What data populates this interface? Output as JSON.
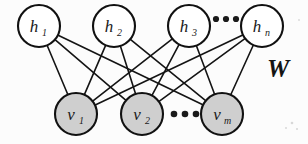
{
  "diagram": {
    "type": "restricted-boltzmann-machine",
    "background_color": "#fcfcfc",
    "edge_color": "#141414",
    "edge_width": 1.6,
    "hidden_layer": {
      "name": "hidden-units",
      "fill_color": "#ffffff",
      "stroke_color": "#111111",
      "stroke_width": 2.1,
      "radius": 21,
      "cy": 26,
      "nodes": [
        {
          "id": "h1",
          "base": "h",
          "sub": "1",
          "cx": 39
        },
        {
          "id": "h2",
          "base": "h",
          "sub": "2",
          "cx": 114
        },
        {
          "id": "h3",
          "base": "h",
          "sub": "3",
          "cx": 189
        },
        {
          "id": "hn",
          "base": "h",
          "sub": "n",
          "cx": 262
        }
      ],
      "ellipsis": {
        "label": "...",
        "cx": 226,
        "cy": 19,
        "dots": 3,
        "dot_radius": 3.1,
        "gap": 10
      }
    },
    "visible_layer": {
      "name": "visible-units",
      "fill_color": "#cfcfcf",
      "stroke_color": "#111111",
      "stroke_width": 2.1,
      "radius": 21,
      "cy": 114,
      "nodes": [
        {
          "id": "v1",
          "base": "v",
          "sub": "1",
          "cx": 76
        },
        {
          "id": "v2",
          "base": "v",
          "sub": "2",
          "cx": 142
        },
        {
          "id": "vm",
          "base": "v",
          "sub": "m",
          "cx": 222
        }
      ],
      "ellipsis": {
        "label": "...",
        "cx": 185,
        "cy": 114,
        "dots": 3,
        "dot_radius": 3.3,
        "gap": 11
      }
    },
    "weight_label": {
      "text": "W",
      "x": 278,
      "y": 77,
      "font_size": 25,
      "color": "#141414"
    },
    "label_font_size": 17,
    "sub_font_size": 10,
    "connections_note": "complete bipartite: every hidden unit connects to every visible unit"
  },
  "chart_data": {
    "type": "diagram",
    "nodes": [
      {
        "layer": "hidden",
        "label": "h1",
        "x": 39,
        "y": 26
      },
      {
        "layer": "hidden",
        "label": "h2",
        "x": 114,
        "y": 26
      },
      {
        "layer": "hidden",
        "label": "h3",
        "x": 189,
        "y": 26
      },
      {
        "layer": "hidden",
        "label": "hn",
        "x": 262,
        "y": 26
      },
      {
        "layer": "visible",
        "label": "v1",
        "x": 76,
        "y": 114
      },
      {
        "layer": "visible",
        "label": "v2",
        "x": 142,
        "y": 114
      },
      {
        "layer": "visible",
        "label": "vm",
        "x": 222,
        "y": 114
      }
    ],
    "edges": [
      [
        "h1",
        "v1"
      ],
      [
        "h1",
        "v2"
      ],
      [
        "h1",
        "vm"
      ],
      [
        "h2",
        "v1"
      ],
      [
        "h2",
        "v2"
      ],
      [
        "h2",
        "vm"
      ],
      [
        "h3",
        "v1"
      ],
      [
        "h3",
        "v2"
      ],
      [
        "h3",
        "vm"
      ],
      [
        "hn",
        "v1"
      ],
      [
        "hn",
        "v2"
      ],
      [
        "hn",
        "vm"
      ]
    ],
    "annotations": [
      "W"
    ]
  }
}
